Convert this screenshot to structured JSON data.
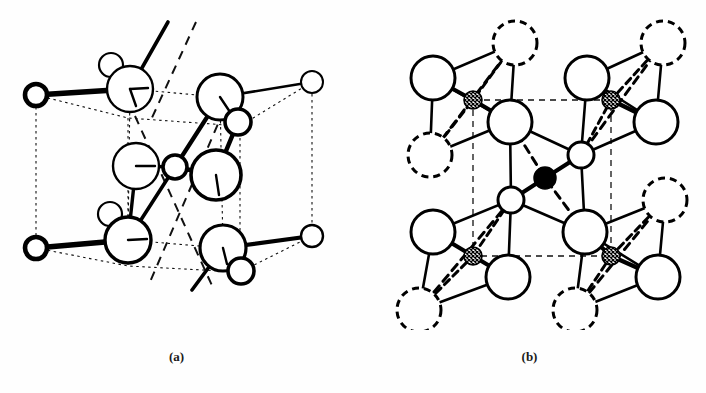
{
  "figure": {
    "background_color": "#fefefe",
    "ink_color": "#000000",
    "panels": [
      {
        "id": "a",
        "caption": "(a)",
        "description": "Unit cell of the crystal structure drawn with dotted cell edges, large open circles and small open circles joined by heavy bonds, with broken lines marking internal directions.",
        "cell_edge_style": "dotted",
        "atoms": [
          {
            "label": "corner-top-left",
            "type": "small-open-heavy",
            "cx": 36,
            "cy": 95,
            "r": 11
          },
          {
            "label": "corner-top-right",
            "type": "small-open-light",
            "cx": 312,
            "cy": 82,
            "r": 11
          },
          {
            "label": "corner-bottom-left",
            "type": "small-open-heavy",
            "cx": 36,
            "cy": 248,
            "r": 11
          },
          {
            "label": "corner-bottom-right",
            "type": "small-open-light",
            "cx": 312,
            "cy": 236,
            "r": 11
          },
          {
            "label": "large-top-left",
            "type": "large-open",
            "cx": 130,
            "cy": 89,
            "r": 23
          },
          {
            "label": "small-top-left",
            "type": "small-open-light",
            "cx": 111,
            "cy": 65,
            "r": 12
          },
          {
            "label": "large-top-right",
            "type": "large-open-heavy",
            "cx": 220,
            "cy": 97,
            "r": 23
          },
          {
            "label": "small-top-right",
            "type": "small-open-heavy",
            "cx": 238,
            "cy": 122,
            "r": 13
          },
          {
            "label": "large-mid-left",
            "type": "large-open",
            "cx": 136,
            "cy": 166,
            "r": 23
          },
          {
            "label": "center-small",
            "type": "small-open-heavy",
            "cx": 175,
            "cy": 167,
            "r": 12
          },
          {
            "label": "large-mid-right",
            "type": "large-open-heavy",
            "cx": 216,
            "cy": 175,
            "r": 25
          },
          {
            "label": "large-bottom-left",
            "type": "large-open-heavy",
            "cx": 128,
            "cy": 240,
            "r": 23
          },
          {
            "label": "small-bottom-left",
            "type": "small-open-light",
            "cx": 110,
            "cy": 214,
            "r": 12
          },
          {
            "label": "large-bottom-right",
            "type": "large-open-heavy",
            "cx": 223,
            "cy": 248,
            "r": 23
          },
          {
            "label": "small-bottom-right",
            "type": "small-open-heavy",
            "cx": 241,
            "cy": 271,
            "r": 13
          }
        ],
        "open_bonds": [
          {
            "from": "large-top-left",
            "to_x": 168,
            "to_y": 22
          },
          {
            "from": "large-bottom-right",
            "to_x": 192,
            "to_y": 290
          }
        ]
      },
      {
        "id": "b",
        "caption": "(b)",
        "description": "Projection showing four corner tetrahedra built around small cross-hatched atoms and one central tetrahedron around a solid black atom; the broken square marks the unit cell outline.",
        "cell_edge_style": "dashed",
        "unit_cell_corners": [
          {
            "x": 120,
            "y": 100
          },
          {
            "x": 258,
            "y": 100
          },
          {
            "x": 258,
            "y": 256
          },
          {
            "x": 120,
            "y": 256
          }
        ],
        "atoms": [
          {
            "label": "hatched-top-left",
            "type": "small-hatched",
            "cx": 120,
            "cy": 100,
            "r": 9
          },
          {
            "label": "hatched-top-right",
            "type": "small-hatched",
            "cx": 258,
            "cy": 100,
            "r": 9
          },
          {
            "label": "hatched-bottom-left",
            "type": "small-hatched",
            "cx": 120,
            "cy": 256,
            "r": 9
          },
          {
            "label": "hatched-bottom-right",
            "type": "small-hatched",
            "cx": 258,
            "cy": 256,
            "r": 9
          },
          {
            "label": "filled-center",
            "type": "small-filled",
            "cx": 192,
            "cy": 178,
            "r": 11
          },
          {
            "label": "open-tl-upper",
            "type": "large-open",
            "cx": 80,
            "cy": 78,
            "r": 22
          },
          {
            "label": "open-tl-right",
            "type": "large-open",
            "cx": 157,
            "cy": 122,
            "r": 22
          },
          {
            "label": "dashed-tl-upper",
            "type": "large-dashed",
            "cx": 162,
            "cy": 43,
            "r": 22
          },
          {
            "label": "dashed-tl-lower",
            "type": "large-dashed",
            "cx": 77,
            "cy": 155,
            "r": 22
          },
          {
            "label": "open-tr-upper",
            "type": "large-open",
            "cx": 234,
            "cy": 78,
            "r": 22
          },
          {
            "label": "open-tr-right",
            "type": "large-open",
            "cx": 303,
            "cy": 122,
            "r": 22
          },
          {
            "label": "dashed-tr-upper",
            "type": "large-dashed",
            "cx": 310,
            "cy": 43,
            "r": 22
          },
          {
            "label": "open-bl-left",
            "type": "large-open",
            "cx": 80,
            "cy": 232,
            "r": 22
          },
          {
            "label": "open-bl-right",
            "type": "large-open",
            "cx": 155,
            "cy": 277,
            "r": 22
          },
          {
            "label": "dashed-bl-lower",
            "type": "large-dashed",
            "cx": 66,
            "cy": 310,
            "r": 22
          },
          {
            "label": "open-br-left",
            "type": "large-open",
            "cx": 232,
            "cy": 232,
            "r": 22
          },
          {
            "label": "open-br-right",
            "type": "large-open",
            "cx": 305,
            "cy": 277,
            "r": 22
          },
          {
            "label": "dashed-br-upper",
            "type": "large-dashed",
            "cx": 312,
            "cy": 200,
            "r": 22
          },
          {
            "label": "dashed-br-lower",
            "type": "large-dashed",
            "cx": 222,
            "cy": 310,
            "r": 22
          },
          {
            "label": "center-small-upper",
            "type": "small-open",
            "cx": 228,
            "cy": 155,
            "r": 13
          },
          {
            "label": "center-small-lower",
            "type": "small-open",
            "cx": 158,
            "cy": 200,
            "r": 13
          }
        ]
      }
    ]
  }
}
